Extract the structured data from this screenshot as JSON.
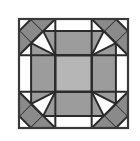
{
  "figure": {
    "title": "",
    "type": "geometric-net-diagram",
    "canvas": {
      "width": 140,
      "height": 141,
      "background": "#ffffff"
    },
    "colors": {
      "stroke": "#2b2b2b",
      "outer_frame_stroke": "#3a3a3a",
      "grid_stroke": "#2b2b2b",
      "corner_fill": "#8a8a8a",
      "arm_fill": "#9c9c9c",
      "center_fill": "#b6b6b6",
      "empty_fill": "#ffffff"
    },
    "geometry": {
      "frame": {
        "x": 19,
        "y": 19,
        "width": 109,
        "height": 109
      },
      "grid_divisions": 3,
      "grid_x": [
        19,
        55.33,
        91.67,
        128
      ],
      "grid_y": [
        19,
        55.33,
        91.67,
        128
      ],
      "stroke_width_frame": 2.2,
      "stroke_width_grid": 2.0,
      "stroke_width_shape": 2.0
    },
    "cells": [
      {
        "name": "cell-top-left",
        "row": 0,
        "col": 0,
        "shape": "diamond",
        "fill": "corner_fill"
      },
      {
        "name": "cell-top-center",
        "row": 0,
        "col": 1,
        "shape": "empty",
        "fill": "empty_fill"
      },
      {
        "name": "cell-top-right",
        "row": 0,
        "col": 2,
        "shape": "diamond",
        "fill": "corner_fill"
      },
      {
        "name": "cell-middle-left",
        "row": 1,
        "col": 0,
        "shape": "empty",
        "fill": "empty_fill"
      },
      {
        "name": "cell-center",
        "row": 1,
        "col": 1,
        "shape": "square",
        "fill": "center_fill"
      },
      {
        "name": "cell-middle-right",
        "row": 1,
        "col": 2,
        "shape": "empty",
        "fill": "empty_fill"
      },
      {
        "name": "cell-bottom-left",
        "row": 2,
        "col": 0,
        "shape": "diamond",
        "fill": "corner_fill"
      },
      {
        "name": "cell-bottom-center",
        "row": 2,
        "col": 1,
        "shape": "empty",
        "fill": "empty_fill"
      },
      {
        "name": "cell-bottom-right",
        "row": 2,
        "col": 2,
        "shape": "diamond",
        "fill": "corner_fill"
      }
    ],
    "arms": [
      {
        "name": "arm-top",
        "direction": "up",
        "fill": "arm_fill"
      },
      {
        "name": "arm-left",
        "direction": "left",
        "fill": "arm_fill"
      },
      {
        "name": "arm-right",
        "direction": "right",
        "fill": "arm_fill"
      },
      {
        "name": "arm-bottom",
        "direction": "down",
        "fill": "arm_fill"
      }
    ],
    "labels": []
  }
}
